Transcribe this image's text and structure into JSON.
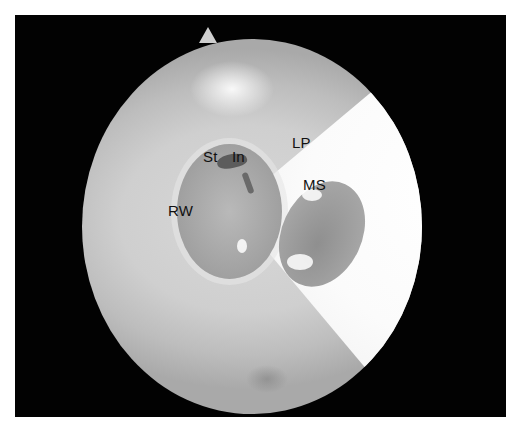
{
  "image": {
    "description": "Endoscopic view of the middle ear through a circular field with anatomical labels",
    "background_color": "#ffffff",
    "frame_color": "#020202",
    "labels": [
      {
        "id": "st",
        "text": "St",
        "x": 203,
        "y": 156
      },
      {
        "id": "in",
        "text": "In",
        "x": 232,
        "y": 156
      },
      {
        "id": "lp",
        "text": "LP",
        "x": 292,
        "y": 142
      },
      {
        "id": "ms",
        "text": "MS",
        "x": 302,
        "y": 178
      },
      {
        "id": "rw",
        "text": "RW",
        "x": 168,
        "y": 203
      }
    ]
  }
}
